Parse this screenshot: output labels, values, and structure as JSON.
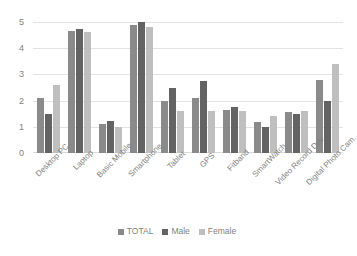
{
  "chart_data": {
    "type": "bar",
    "title": "",
    "xlabel": "",
    "ylabel": "",
    "ylim": [
      0,
      5
    ],
    "yticks": [
      "0",
      "1",
      "2",
      "3",
      "4",
      "5"
    ],
    "grid": true,
    "legend_position": "bottom",
    "categories": [
      "Desktop PC",
      "Laptop",
      "Basic Mobile",
      "Smartphone",
      "Tablet",
      "GPS",
      "Fitband",
      "SmartWatch",
      "Video Record Dev.",
      "Digital Photo Cam."
    ],
    "series": [
      {
        "name": "TOTAL",
        "color": "#8a8a8a",
        "values": [
          2.1,
          4.65,
          1.1,
          4.9,
          2.0,
          2.1,
          1.65,
          1.2,
          1.55,
          2.8
        ]
      },
      {
        "name": "Male",
        "color": "#636363",
        "values": [
          1.5,
          4.75,
          1.23,
          5.0,
          2.5,
          2.75,
          1.75,
          1.0,
          1.5,
          2.0
        ]
      },
      {
        "name": "Female",
        "color": "#bfbfbf",
        "values": [
          2.6,
          4.6,
          1.0,
          4.8,
          1.6,
          1.6,
          1.6,
          1.4,
          1.6,
          3.4
        ]
      }
    ]
  },
  "colors": {
    "gridline": "#e3e3e3",
    "axis_text": "#7f7f7f",
    "background": "#ffffff"
  }
}
